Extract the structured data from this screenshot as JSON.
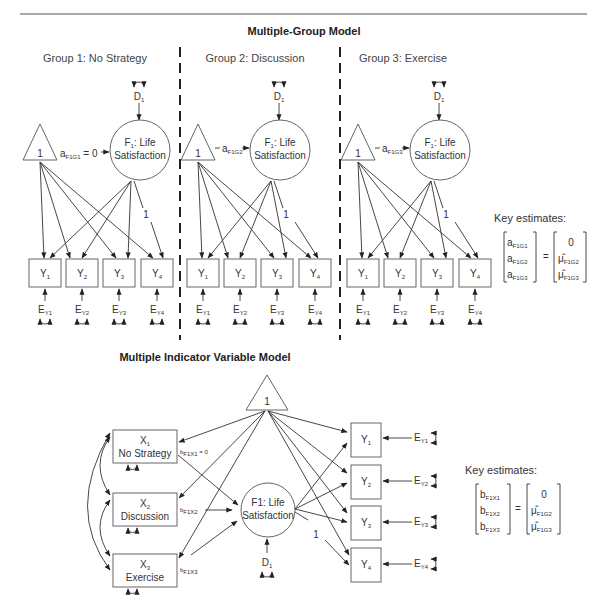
{
  "multiple_group_model": {
    "title": "Multiple-Group Model",
    "groups": [
      {
        "label": "Group 1: No Strategy",
        "path_label": "a",
        "path_sub": "F1G1",
        "path_suffix": " = 0"
      },
      {
        "label": "Group 2: Discussion",
        "path_label": "a",
        "path_sub": "F1G2",
        "path_suffix": ""
      },
      {
        "label": "Group 3: Exercise",
        "path_label": "a",
        "path_sub": "F1G3",
        "path_suffix": ""
      }
    ],
    "constant": "1",
    "factor_line1": "F",
    "factor_line1_sub": "1",
    "factor_line1_rest": ": Life",
    "factor_line2": "Satisfaction",
    "disturbance": "D",
    "disturbance_sub": "1",
    "loading_fixed": "1",
    "indicators": [
      {
        "name": "Y",
        "sub": "1",
        "error": "E",
        "error_sub": "Y1"
      },
      {
        "name": "Y",
        "sub": "2",
        "error": "E",
        "error_sub": "Y2"
      },
      {
        "name": "Y",
        "sub": "3",
        "error": "E",
        "error_sub": "Y3"
      },
      {
        "name": "Y",
        "sub": "4",
        "error": "E",
        "error_sub": "Y4"
      }
    ],
    "key_estimates": {
      "label": "Key estimates:",
      "left": [
        {
          "main": "a",
          "sub": "F1G1"
        },
        {
          "main": "a",
          "sub": "F1G2"
        },
        {
          "main": "a",
          "sub": "F1G3"
        }
      ],
      "equals": "=",
      "right": [
        {
          "main": "0",
          "sub": ""
        },
        {
          "main": "μ̂",
          "sub": "F1G2"
        },
        {
          "main": "μ̂",
          "sub": "F1G3"
        }
      ]
    }
  },
  "mimic_model": {
    "title": "Multiple Indicator Variable Model",
    "constant": "1",
    "predictors": [
      {
        "name": "X",
        "sub": "1",
        "label": "No Strategy",
        "path": "b",
        "path_sub": "F1X1",
        "path_suffix": " = 0"
      },
      {
        "name": "X",
        "sub": "2",
        "label": "Discussion",
        "path": "b",
        "path_sub": "F1X2",
        "path_suffix": ""
      },
      {
        "name": "X",
        "sub": "3",
        "label": "Exercise",
        "path": "b",
        "path_sub": "F1X3",
        "path_suffix": ""
      }
    ],
    "factor_line1": "F1: Life",
    "factor_line2": "Satisfaction",
    "disturbance": "D",
    "disturbance_sub": "1",
    "loading_fixed": "1",
    "indicators": [
      {
        "name": "Y",
        "sub": "1",
        "error": "E",
        "error_sub": "Y1"
      },
      {
        "name": "Y",
        "sub": "2",
        "error": "E",
        "error_sub": "Y2"
      },
      {
        "name": "Y",
        "sub": "3",
        "error": "E",
        "error_sub": "Y3"
      },
      {
        "name": "Y",
        "sub": "4",
        "error": "E",
        "error_sub": "Y4"
      }
    ],
    "key_estimates": {
      "label": "Key estimates:",
      "left": [
        {
          "main": "b",
          "sub": "F1X1"
        },
        {
          "main": "b",
          "sub": "F1X2"
        },
        {
          "main": "b",
          "sub": "F1X3"
        }
      ],
      "equals": "=",
      "right": [
        {
          "main": "0",
          "sub": ""
        },
        {
          "main": "μ̂",
          "sub": "F1G2"
        },
        {
          "main": "μ̂",
          "sub": "F1G3"
        }
      ]
    }
  }
}
